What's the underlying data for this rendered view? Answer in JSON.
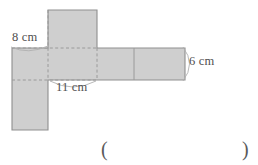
{
  "figure": {
    "type": "geometry-net",
    "fill_color": "#cfcfcf",
    "outline_color": "#8f8f8f",
    "dashed_color": "#9a9a9a",
    "leader_color": "#a8a8a8",
    "faces": [
      {
        "name": "top-face",
        "x": 48,
        "y": 10,
        "w": 49,
        "h": 38,
        "style": "solid-outline"
      },
      {
        "name": "left-upper-face",
        "x": 12,
        "y": 48,
        "w": 36,
        "h": 32,
        "style": "solid-outline"
      },
      {
        "name": "left-lower-face",
        "x": 12,
        "y": 80,
        "w": 36,
        "h": 50,
        "style": "solid-outline"
      },
      {
        "name": "center-face",
        "x": 48,
        "y": 48,
        "w": 49,
        "h": 32,
        "style": "dashed-interior"
      },
      {
        "name": "right-inner-face",
        "x": 97,
        "y": 48,
        "w": 37,
        "h": 32,
        "style": "solid-outline"
      },
      {
        "name": "right-outer-face",
        "x": 134,
        "y": 48,
        "w": 51,
        "h": 32,
        "style": "solid-outline"
      }
    ],
    "labels": [
      {
        "name": "label-8cm",
        "text": "8 cm",
        "refers_to": "left-upper-face-width"
      },
      {
        "name": "label-11cm",
        "text": "11 cm",
        "refers_to": "center-face-width"
      },
      {
        "name": "label-6cm",
        "text": "6 cm",
        "refers_to": "right-outer-face-height"
      }
    ],
    "dimensions": {
      "width_label": "8 cm",
      "length_label": "11 cm",
      "height_label": "6 cm"
    }
  },
  "answer": {
    "open_paren": "(",
    "close_paren": ")",
    "value": ""
  }
}
